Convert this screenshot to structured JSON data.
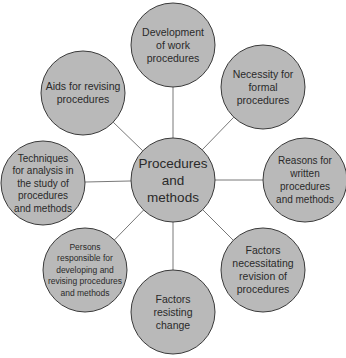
{
  "diagram": {
    "type": "hub-and-spoke",
    "colors": {
      "node_fill": "#b9b9b9",
      "node_stroke": "#3a3a3a",
      "edge": "#555555",
      "text": "#2a2a2a"
    },
    "center": {
      "id": "center",
      "lines": [
        "Procedures",
        "and",
        "methods"
      ]
    },
    "satellites": [
      {
        "id": "development",
        "position": "top",
        "lines": [
          "Development",
          "of work",
          "procedures"
        ]
      },
      {
        "id": "necessity",
        "position": "top-right",
        "lines": [
          "Necessity for",
          "formal",
          "procedures"
        ]
      },
      {
        "id": "reasons",
        "position": "right",
        "lines": [
          "Reasons for",
          "written",
          "procedures",
          "and methods"
        ]
      },
      {
        "id": "factors-revision",
        "position": "bottom-right",
        "lines": [
          "Factors",
          "necessitating",
          "revision of",
          "procedures"
        ]
      },
      {
        "id": "factors-resisting",
        "position": "bottom",
        "lines": [
          "Factors",
          "resisting",
          "change"
        ]
      },
      {
        "id": "persons",
        "position": "bottom-left",
        "lines": [
          "Persons",
          "responsible for",
          "developing and",
          "revising procedures",
          "and methods"
        ]
      },
      {
        "id": "techniques",
        "position": "left",
        "lines": [
          "Techniques",
          "for analysis in",
          "the study of",
          "procedures",
          "and methods"
        ]
      },
      {
        "id": "aids",
        "position": "top-left",
        "lines": [
          "Aids for revising",
          "procedures"
        ]
      }
    ]
  }
}
